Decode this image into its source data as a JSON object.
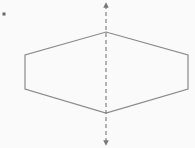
{
  "diagram": {
    "type": "geometry",
    "shape": "hexagon",
    "hexagon_points": [
      [
        106,
        32
      ],
      [
        188,
        55
      ],
      [
        188,
        89
      ],
      [
        106,
        113
      ],
      [
        25,
        89
      ],
      [
        25,
        55
      ]
    ],
    "symmetry_axis": {
      "x": 106,
      "y1": 5,
      "y2": 143,
      "style": "dashed",
      "arrows": "both"
    },
    "bullet_dot": {
      "x": 4,
      "y": 14
    },
    "colors": {
      "background": "#fafafa",
      "stroke": "#8a8a8a",
      "axis": "#777777",
      "dot": "#666666"
    }
  }
}
